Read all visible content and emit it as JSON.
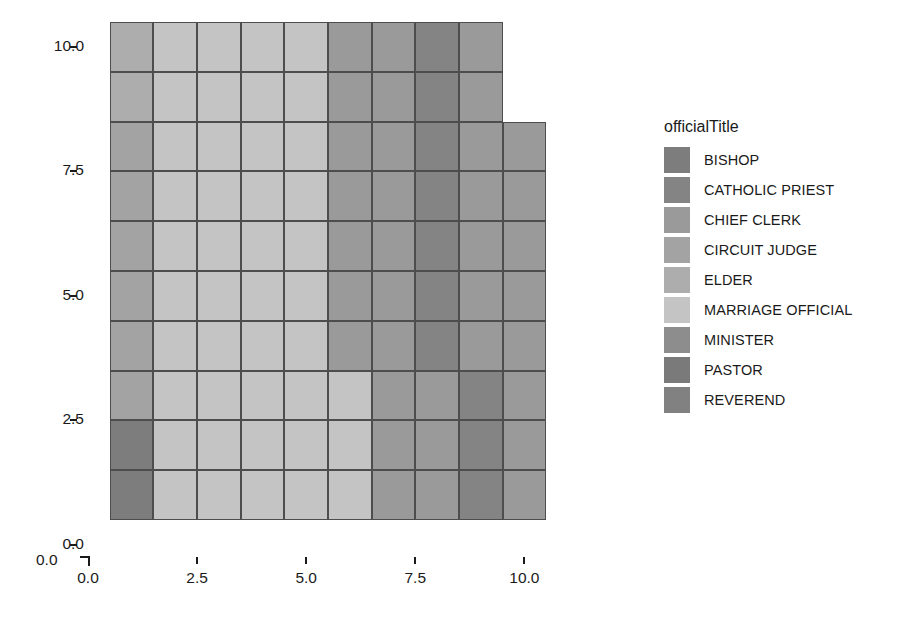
{
  "chart_data": {
    "type": "heatmap",
    "title": "",
    "xlabel": "",
    "ylabel": "",
    "xlim": [
      0.0,
      11.0
    ],
    "ylim": [
      0.0,
      10.5
    ],
    "grid": true,
    "legend_position": "right",
    "x_ticks": [
      "0.0",
      "2.5",
      "5.0",
      "7.5",
      "10.0"
    ],
    "x_tick_values": [
      0.0,
      2.5,
      5.0,
      7.5,
      10.0
    ],
    "y_ticks": [
      "0.0",
      "2.5",
      "5.0",
      "7.5",
      "10.0"
    ],
    "y_tick_values": [
      0.0,
      2.5,
      5.0,
      7.5,
      10.0
    ],
    "origin_label": "0.0",
    "legend_title": "officialTitle",
    "categories": [
      {
        "label": "BISHOP",
        "color": "#7d7d7d"
      },
      {
        "label": "CATHOLIC PRIEST",
        "color": "#848484"
      },
      {
        "label": "CHIEF CLERK",
        "color": "#9a9a9a"
      },
      {
        "label": "CIRCUIT JUDGE",
        "color": "#a3a3a3"
      },
      {
        "label": "ELDER",
        "color": "#adadad"
      },
      {
        "label": "MARRIAGE OFFICIAL",
        "color": "#c4c4c4"
      },
      {
        "label": "MINISTER",
        "color": "#8d8d8d"
      },
      {
        "label": "PASTOR",
        "color": "#7a7a7a"
      },
      {
        "label": "REVEREND",
        "color": "#818181"
      }
    ],
    "cell_size": 1.0,
    "cells": [
      {
        "x": 0,
        "y": 9,
        "category": 4
      },
      {
        "x": 1,
        "y": 9,
        "category": 5
      },
      {
        "x": 2,
        "y": 9,
        "category": 5
      },
      {
        "x": 3,
        "y": 9,
        "category": 5
      },
      {
        "x": 4,
        "y": 9,
        "category": 5
      },
      {
        "x": 5,
        "y": 9,
        "category": 2
      },
      {
        "x": 6,
        "y": 9,
        "category": 2
      },
      {
        "x": 7,
        "y": 9,
        "category": 1
      },
      {
        "x": 8,
        "y": 9,
        "category": 2
      },
      {
        "x": 0,
        "y": 8,
        "category": 4
      },
      {
        "x": 1,
        "y": 8,
        "category": 5
      },
      {
        "x": 2,
        "y": 8,
        "category": 5
      },
      {
        "x": 3,
        "y": 8,
        "category": 5
      },
      {
        "x": 4,
        "y": 8,
        "category": 5
      },
      {
        "x": 5,
        "y": 8,
        "category": 2
      },
      {
        "x": 6,
        "y": 8,
        "category": 2
      },
      {
        "x": 7,
        "y": 8,
        "category": 1
      },
      {
        "x": 8,
        "y": 8,
        "category": 2
      },
      {
        "x": 0,
        "y": 7,
        "category": 3
      },
      {
        "x": 1,
        "y": 7,
        "category": 5
      },
      {
        "x": 2,
        "y": 7,
        "category": 5
      },
      {
        "x": 3,
        "y": 7,
        "category": 5
      },
      {
        "x": 4,
        "y": 7,
        "category": 5
      },
      {
        "x": 5,
        "y": 7,
        "category": 2
      },
      {
        "x": 6,
        "y": 7,
        "category": 2
      },
      {
        "x": 7,
        "y": 7,
        "category": 1
      },
      {
        "x": 8,
        "y": 7,
        "category": 2
      },
      {
        "x": 9,
        "y": 7,
        "category": 2
      },
      {
        "x": 0,
        "y": 6,
        "category": 3
      },
      {
        "x": 1,
        "y": 6,
        "category": 5
      },
      {
        "x": 2,
        "y": 6,
        "category": 5
      },
      {
        "x": 3,
        "y": 6,
        "category": 5
      },
      {
        "x": 4,
        "y": 6,
        "category": 5
      },
      {
        "x": 5,
        "y": 6,
        "category": 2
      },
      {
        "x": 6,
        "y": 6,
        "category": 2
      },
      {
        "x": 7,
        "y": 6,
        "category": 1
      },
      {
        "x": 8,
        "y": 6,
        "category": 2
      },
      {
        "x": 9,
        "y": 6,
        "category": 2
      },
      {
        "x": 0,
        "y": 5,
        "category": 3
      },
      {
        "x": 1,
        "y": 5,
        "category": 5
      },
      {
        "x": 2,
        "y": 5,
        "category": 5
      },
      {
        "x": 3,
        "y": 5,
        "category": 5
      },
      {
        "x": 4,
        "y": 5,
        "category": 5
      },
      {
        "x": 5,
        "y": 5,
        "category": 2
      },
      {
        "x": 6,
        "y": 5,
        "category": 2
      },
      {
        "x": 7,
        "y": 5,
        "category": 1
      },
      {
        "x": 8,
        "y": 5,
        "category": 2
      },
      {
        "x": 9,
        "y": 5,
        "category": 2
      },
      {
        "x": 0,
        "y": 4,
        "category": 3
      },
      {
        "x": 1,
        "y": 4,
        "category": 5
      },
      {
        "x": 2,
        "y": 4,
        "category": 5
      },
      {
        "x": 3,
        "y": 4,
        "category": 5
      },
      {
        "x": 4,
        "y": 4,
        "category": 5
      },
      {
        "x": 5,
        "y": 4,
        "category": 2
      },
      {
        "x": 6,
        "y": 4,
        "category": 2
      },
      {
        "x": 7,
        "y": 4,
        "category": 1
      },
      {
        "x": 8,
        "y": 4,
        "category": 2
      },
      {
        "x": 9,
        "y": 4,
        "category": 2
      },
      {
        "x": 0,
        "y": 3,
        "category": 3
      },
      {
        "x": 1,
        "y": 3,
        "category": 5
      },
      {
        "x": 2,
        "y": 3,
        "category": 5
      },
      {
        "x": 3,
        "y": 3,
        "category": 5
      },
      {
        "x": 4,
        "y": 3,
        "category": 5
      },
      {
        "x": 5,
        "y": 3,
        "category": 2
      },
      {
        "x": 6,
        "y": 3,
        "category": 2
      },
      {
        "x": 7,
        "y": 3,
        "category": 1
      },
      {
        "x": 8,
        "y": 3,
        "category": 2
      },
      {
        "x": 9,
        "y": 3,
        "category": 2
      },
      {
        "x": 0,
        "y": 2,
        "category": 3
      },
      {
        "x": 1,
        "y": 2,
        "category": 5
      },
      {
        "x": 2,
        "y": 2,
        "category": 5
      },
      {
        "x": 3,
        "y": 2,
        "category": 5
      },
      {
        "x": 4,
        "y": 2,
        "category": 5
      },
      {
        "x": 5,
        "y": 2,
        "category": 5
      },
      {
        "x": 6,
        "y": 2,
        "category": 2
      },
      {
        "x": 7,
        "y": 2,
        "category": 2
      },
      {
        "x": 8,
        "y": 2,
        "category": 1
      },
      {
        "x": 9,
        "y": 2,
        "category": 2
      },
      {
        "x": 0,
        "y": 1,
        "category": 0
      },
      {
        "x": 1,
        "y": 1,
        "category": 5
      },
      {
        "x": 2,
        "y": 1,
        "category": 5
      },
      {
        "x": 3,
        "y": 1,
        "category": 5
      },
      {
        "x": 4,
        "y": 1,
        "category": 5
      },
      {
        "x": 5,
        "y": 1,
        "category": 5
      },
      {
        "x": 6,
        "y": 1,
        "category": 2
      },
      {
        "x": 7,
        "y": 1,
        "category": 2
      },
      {
        "x": 8,
        "y": 1,
        "category": 1
      },
      {
        "x": 9,
        "y": 1,
        "category": 2
      },
      {
        "x": 0,
        "y": 0,
        "category": 0
      },
      {
        "x": 1,
        "y": 0,
        "category": 5
      },
      {
        "x": 2,
        "y": 0,
        "category": 5
      },
      {
        "x": 3,
        "y": 0,
        "category": 5
      },
      {
        "x": 4,
        "y": 0,
        "category": 5
      },
      {
        "x": 5,
        "y": 0,
        "category": 5
      },
      {
        "x": 6,
        "y": 0,
        "category": 2
      },
      {
        "x": 7,
        "y": 0,
        "category": 2
      },
      {
        "x": 8,
        "y": 0,
        "category": 1
      },
      {
        "x": 9,
        "y": 0,
        "category": 2
      }
    ]
  }
}
